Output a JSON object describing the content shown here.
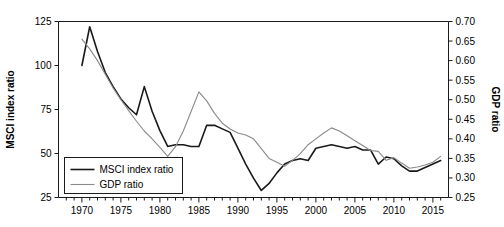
{
  "chart_data": {
    "type": "line",
    "title": "",
    "xlabel": "",
    "ylabel": "MSCI index ratio",
    "y2label": "GDP ratio",
    "grid": false,
    "legend_position": "lower-left-inside",
    "xlim": [
      1967,
      2017
    ],
    "ylim": [
      25,
      125
    ],
    "y2lim": [
      0.25,
      0.7
    ],
    "xticks_major": [
      1970,
      1975,
      1980,
      1985,
      1990,
      1995,
      2000,
      2005,
      2010,
      2015
    ],
    "xticks_minor_step": 1,
    "yticks": [
      25,
      50,
      75,
      100,
      125
    ],
    "y2ticks": [
      0.25,
      0.3,
      0.35,
      0.4,
      0.45,
      0.5,
      0.55,
      0.6,
      0.65,
      0.7
    ],
    "series": [
      {
        "name": "MSCI index ratio",
        "axis": "left",
        "color": "#1a1a1a",
        "width": 1.6,
        "x": [
          1970,
          1971,
          1972,
          1973,
          1974,
          1975,
          1976,
          1977,
          1978,
          1979,
          1980,
          1981,
          1982,
          1983,
          1984,
          1985,
          1986,
          1987,
          1988,
          1989,
          1990,
          1991,
          1992,
          1993,
          1994,
          1995,
          1996,
          1997,
          1998,
          1999,
          2000,
          2001,
          2002,
          2003,
          2004,
          2005,
          2006,
          2007,
          2008,
          2009,
          2010,
          2011,
          2012,
          2013,
          2014,
          2015,
          2016
        ],
        "values": [
          100,
          122,
          108,
          96,
          88,
          81,
          76,
          72,
          88,
          74,
          63,
          54,
          55,
          55,
          54,
          54,
          66,
          66,
          64,
          62,
          53,
          44,
          36,
          29,
          33,
          39,
          44,
          46,
          47,
          46,
          53,
          54,
          55,
          54,
          53,
          54,
          52,
          52,
          44,
          48,
          47,
          43,
          40,
          40,
          42,
          44,
          46
        ]
      },
      {
        "name": "GDP ratio",
        "axis": "right",
        "color": "#8a8a8a",
        "width": 1.1,
        "x": [
          1970,
          1971,
          1972,
          1973,
          1974,
          1975,
          1976,
          1977,
          1978,
          1979,
          1980,
          1981,
          1982,
          1983,
          1984,
          1985,
          1986,
          1987,
          1988,
          1989,
          1990,
          1991,
          1992,
          1993,
          1994,
          1995,
          1996,
          1997,
          1998,
          1999,
          2000,
          2001,
          2002,
          2003,
          2004,
          2005,
          2006,
          2007,
          2008,
          2009,
          2010,
          2011,
          2012,
          2013,
          2014,
          2015,
          2016
        ],
        "values": [
          0.655,
          0.63,
          0.6,
          0.565,
          0.53,
          0.5,
          0.472,
          0.445,
          0.42,
          0.4,
          0.378,
          0.355,
          0.38,
          0.42,
          0.47,
          0.52,
          0.497,
          0.465,
          0.44,
          0.425,
          0.415,
          0.41,
          0.4,
          0.375,
          0.35,
          0.34,
          0.33,
          0.345,
          0.362,
          0.385,
          0.4,
          0.415,
          0.428,
          0.42,
          0.408,
          0.395,
          0.383,
          0.37,
          0.368,
          0.345,
          0.352,
          0.338,
          0.325,
          0.328,
          0.333,
          0.34,
          0.355
        ]
      }
    ],
    "legend": [
      {
        "label": "MSCI index ratio",
        "color": "#1a1a1a",
        "width": 1.6
      },
      {
        "label": "GDP ratio",
        "color": "#8a8a8a",
        "width": 1.1
      }
    ]
  },
  "labels": {
    "y_axis_title": "MSCI index ratio",
    "y2_axis_title": "GDP ratio",
    "ytick_text": [
      "25",
      "50",
      "75",
      "100",
      "125"
    ],
    "y2tick_text": [
      "0.25",
      "0.30",
      "0.35",
      "0.40",
      "0.45",
      "0.50",
      "0.55",
      "0.60",
      "0.65",
      "0.70"
    ],
    "xtick_text": [
      "1970",
      "1975",
      "1980",
      "1985",
      "1990",
      "1995",
      "2000",
      "2005",
      "2010",
      "2015"
    ],
    "legend_msci": "MSCI index ratio",
    "legend_gdp": "GDP ratio"
  },
  "colors": {
    "axis": "#1a1a1a",
    "msci": "#1a1a1a",
    "gdp": "#8a8a8a",
    "background": "#ffffff"
  }
}
